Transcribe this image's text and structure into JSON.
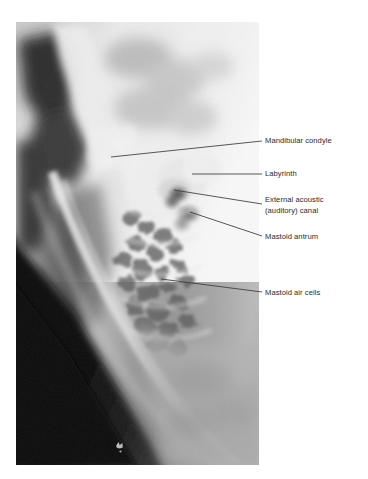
{
  "figure": {
    "kind": "radiograph-with-annotations",
    "modality": "plain-film-radiograph",
    "view": "lateral oblique of the temporal bone / mastoid",
    "background_color": "#ffffff",
    "ink_color": "#2a2a2a",
    "leader_line_color": "#3a3a3a"
  },
  "xray": {
    "name": "temporal-bone-radiograph",
    "left": 16,
    "top": 22,
    "width": 243,
    "height": 443,
    "tone_light": "#fbfbfb",
    "tone_mid": "#b4b4b4",
    "tone_dark": "#3d3d3d",
    "tone_black": "#0d0d0d",
    "marker_note": "small radio-opaque marker low in the dark soft-tissue field"
  },
  "annotations": [
    {
      "id": "mandibular-condyle",
      "text": "Mandibular condyle",
      "label_x": 265,
      "label_y": 136,
      "leader": {
        "x1": 111,
        "y1": 157,
        "x2": 262,
        "y2": 141
      }
    },
    {
      "id": "labyrinth",
      "text": "Labyrinth",
      "label_x": 265,
      "label_y": 169,
      "leader": {
        "x1": 192,
        "y1": 174,
        "x2": 262,
        "y2": 174
      }
    },
    {
      "id": "external-acoustic-auditory-canal",
      "text": "External acoustic\n(auditory) canal",
      "label_x": 265,
      "label_y": 195,
      "leader": {
        "x1": 174,
        "y1": 190,
        "x2": 262,
        "y2": 204
      }
    },
    {
      "id": "mastoid-antrum",
      "text": "Mastoid antrum",
      "label_x": 265,
      "label_y": 232,
      "leader": {
        "x1": 190,
        "y1": 212,
        "x2": 262,
        "y2": 236
      }
    },
    {
      "id": "mastoid-air-cells",
      "text": "Mastoid air cells",
      "label_x": 265,
      "label_y": 288,
      "leader": {
        "x1": 161,
        "y1": 279,
        "x2": 262,
        "y2": 292
      }
    }
  ]
}
